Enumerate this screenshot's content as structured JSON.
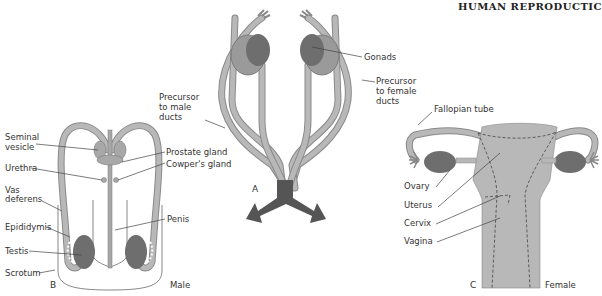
{
  "header": {
    "title": "HUMAN REPRODUCTIC"
  },
  "panels": {
    "A": {
      "letter": "A",
      "labels": {
        "gonads": "Gonads",
        "precursor_female_1": "Precursor",
        "precursor_female_2": "to female",
        "precursor_female_3": "ducts",
        "precursor_male_1": "Precursor",
        "precursor_male_2": "to male",
        "precursor_male_3": "ducts"
      }
    },
    "B": {
      "letter": "B",
      "caption": "Male",
      "labels": {
        "seminal_1": "Seminal",
        "seminal_2": "vesicle",
        "urethra": "Urethra",
        "vas_1": "Vas",
        "vas_2": "deferens",
        "epididymis": "Epididymis",
        "testis": "Testis",
        "scrotum": "Scrotum",
        "prostate": "Prostate gland",
        "cowper": "Cowper's gland",
        "penis": "Penis"
      }
    },
    "C": {
      "letter": "C",
      "caption": "Female",
      "labels": {
        "fallopian": "Fallopian tube",
        "ovary": "Ovary",
        "uterus": "Uterus",
        "cervix": "Cervix",
        "vagina": "Vagina"
      }
    }
  },
  "colors": {
    "tissue": "#b8b8b8",
    "outline": "#7a7a7a",
    "gonad": "#6e6e6e",
    "arrow": "#555555"
  }
}
